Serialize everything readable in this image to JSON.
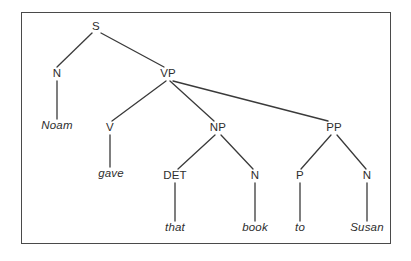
{
  "figure": {
    "kind": "constituency-syntax-tree",
    "sentence": "Noam gave that book to Susan",
    "border_color": "#4a4a4a",
    "line_color": "#3a3a3a",
    "text_color": "#2e2e2e",
    "background_color": "#ffffff"
  },
  "nodes": [
    {
      "id": "S",
      "label": "S",
      "x": 96,
      "y": 27,
      "style": "category"
    },
    {
      "id": "N1",
      "label": "N",
      "x": 57,
      "y": 74,
      "style": "category"
    },
    {
      "id": "VP",
      "label": "VP",
      "x": 168,
      "y": 74,
      "style": "category"
    },
    {
      "id": "V",
      "label": "V",
      "x": 110,
      "y": 128,
      "style": "category"
    },
    {
      "id": "NP",
      "label": "NP",
      "x": 218,
      "y": 128,
      "style": "category"
    },
    {
      "id": "PP",
      "label": "PP",
      "x": 334,
      "y": 128,
      "style": "category"
    },
    {
      "id": "DET",
      "label": "DET",
      "x": 175,
      "y": 176,
      "style": "category"
    },
    {
      "id": "N2",
      "label": "N",
      "x": 255,
      "y": 176,
      "style": "category"
    },
    {
      "id": "P",
      "label": "P",
      "x": 300,
      "y": 176,
      "style": "category"
    },
    {
      "id": "N3",
      "label": "N",
      "x": 367,
      "y": 176,
      "style": "category"
    }
  ],
  "terminals": [
    {
      "id": "t_noam",
      "label": "Noam",
      "x": 57,
      "y": 126
    },
    {
      "id": "t_gave",
      "label": "gave",
      "x": 111,
      "y": 174
    },
    {
      "id": "t_that",
      "label": "that",
      "x": 175,
      "y": 228
    },
    {
      "id": "t_book",
      "label": "book",
      "x": 255,
      "y": 228
    },
    {
      "id": "t_to",
      "label": "to",
      "x": 300,
      "y": 228
    },
    {
      "id": "t_susan",
      "label": "Susan",
      "x": 367,
      "y": 228
    }
  ],
  "edges": [
    {
      "from": "S",
      "to": "N1",
      "x1": 92,
      "y1": 33,
      "x2": 57,
      "y2": 67
    },
    {
      "from": "S",
      "to": "VP",
      "x1": 101,
      "y1": 33,
      "x2": 164,
      "y2": 67
    },
    {
      "from": "N1",
      "to": "t_noam",
      "x1": 57,
      "y1": 81,
      "x2": 57,
      "y2": 119
    },
    {
      "from": "VP",
      "to": "V",
      "x1": 166,
      "y1": 81,
      "x2": 112,
      "y2": 121
    },
    {
      "from": "VP",
      "to": "NP",
      "x1": 170,
      "y1": 81,
      "x2": 214,
      "y2": 121
    },
    {
      "from": "VP",
      "to": "PP",
      "x1": 173,
      "y1": 81,
      "x2": 328,
      "y2": 121
    },
    {
      "from": "V",
      "to": "t_gave",
      "x1": 110,
      "y1": 135,
      "x2": 110,
      "y2": 167
    },
    {
      "from": "NP",
      "to": "DET",
      "x1": 215,
      "y1": 135,
      "x2": 178,
      "y2": 169
    },
    {
      "from": "NP",
      "to": "N2",
      "x1": 221,
      "y1": 135,
      "x2": 253,
      "y2": 169
    },
    {
      "from": "PP",
      "to": "P",
      "x1": 331,
      "y1": 135,
      "x2": 301,
      "y2": 169
    },
    {
      "from": "PP",
      "to": "N3",
      "x1": 337,
      "y1": 135,
      "x2": 366,
      "y2": 169
    },
    {
      "from": "DET",
      "to": "t_that",
      "x1": 175,
      "y1": 183,
      "x2": 175,
      "y2": 221
    },
    {
      "from": "N2",
      "to": "t_book",
      "x1": 255,
      "y1": 183,
      "x2": 255,
      "y2": 221
    },
    {
      "from": "P",
      "to": "t_to",
      "x1": 300,
      "y1": 183,
      "x2": 300,
      "y2": 221
    },
    {
      "from": "N3",
      "to": "t_susan",
      "x1": 367,
      "y1": 183,
      "x2": 367,
      "y2": 221
    }
  ]
}
